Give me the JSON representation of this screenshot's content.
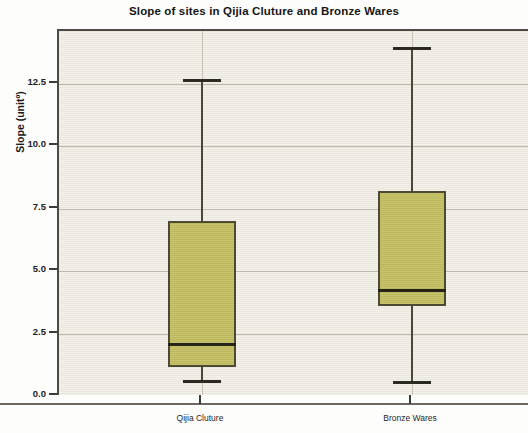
{
  "chart_data": {
    "type": "box",
    "title": "Slope of sites in Qijia Cluture and Bronze Wares",
    "xlabel": "",
    "ylabel": "Slope (unitº)",
    "categories": [
      "Qijia Cluture",
      "Bronze Wares"
    ],
    "ylim": [
      0.0,
      14.6
    ],
    "yticks": [
      0.0,
      2.5,
      5.0,
      7.5,
      10.0,
      12.5
    ],
    "ytick_labels": [
      "0.0",
      "2.5",
      "5.0",
      "7.5",
      "10.0",
      "12.5"
    ],
    "grid": "horizontal-and-vertical",
    "legend": "none",
    "box_color": "#c2bd5e",
    "box_edge_color": "#4c4a33",
    "plot_background": "#eeeae1",
    "series": [
      {
        "name": "Qijia Cluture",
        "whisker_low": 0.65,
        "q1": 1.15,
        "median": 2.1,
        "q3": 7.0,
        "whisker_high": 12.7
      },
      {
        "name": "Bronze Wares",
        "whisker_low": 0.6,
        "q1": 3.6,
        "median": 4.25,
        "q3": 8.2,
        "whisker_high": 14.0
      }
    ]
  },
  "axis": {
    "y_title": "Slope (unitº)",
    "y_labels": [
      "12.5",
      "10.0",
      "7.5",
      "5.0",
      "2.5",
      "0.0"
    ],
    "x_labels": [
      "Qijia Cluture",
      "Bronze Wares"
    ]
  },
  "header": {
    "title": "Slope of sites in Qijia Cluture and Bronze Wares"
  }
}
